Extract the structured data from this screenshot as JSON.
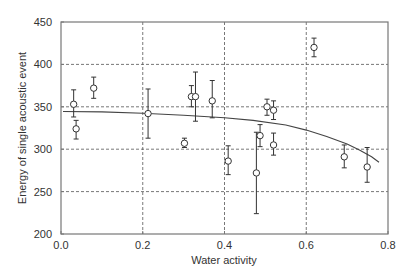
{
  "chart_data": {
    "type": "scatter",
    "title": "",
    "xlabel": "Water activity",
    "ylabel": "Energy of single acoustic event",
    "xlim": [
      0.0,
      0.8
    ],
    "ylim": [
      200,
      450
    ],
    "xticks": [
      "0.0",
      "0.2",
      "0.4",
      "0.6",
      "0.8"
    ],
    "yticks": [
      "200",
      "250",
      "300",
      "350",
      "400",
      "450"
    ],
    "grid": true,
    "legend": null,
    "series": [
      {
        "name": "Measured",
        "marker": "open-circle",
        "points": [
          {
            "x": 0.031,
            "y": 353,
            "err_low": 338,
            "err_high": 370
          },
          {
            "x": 0.037,
            "y": 324,
            "err_low": 312,
            "err_high": 334
          },
          {
            "x": 0.08,
            "y": 372,
            "err_low": 360,
            "err_high": 385
          },
          {
            "x": 0.213,
            "y": 342,
            "err_low": 313,
            "err_high": 371
          },
          {
            "x": 0.302,
            "y": 307,
            "err_low": 302,
            "err_high": 313
          },
          {
            "x": 0.319,
            "y": 362,
            "err_low": 350,
            "err_high": 375
          },
          {
            "x": 0.329,
            "y": 362,
            "err_low": 333,
            "err_high": 391
          },
          {
            "x": 0.37,
            "y": 357,
            "err_low": 337,
            "err_high": 381
          },
          {
            "x": 0.409,
            "y": 286,
            "err_low": 270,
            "err_high": 304
          },
          {
            "x": 0.478,
            "y": 272,
            "err_low": 224,
            "err_high": 320
          },
          {
            "x": 0.487,
            "y": 316,
            "err_low": 303,
            "err_high": 329
          },
          {
            "x": 0.504,
            "y": 350,
            "err_low": 340,
            "err_high": 359
          },
          {
            "x": 0.52,
            "y": 346,
            "err_low": 335,
            "err_high": 357
          },
          {
            "x": 0.52,
            "y": 305,
            "err_low": 293,
            "err_high": 319
          },
          {
            "x": 0.619,
            "y": 420,
            "err_low": 409,
            "err_high": 431
          },
          {
            "x": 0.693,
            "y": 291,
            "err_low": 278,
            "err_high": 305
          },
          {
            "x": 0.749,
            "y": 279,
            "err_low": 261,
            "err_high": 302
          }
        ]
      },
      {
        "name": "Fit",
        "type": "line",
        "x": [
          0.005,
          0.1,
          0.2,
          0.3,
          0.4,
          0.47,
          0.55,
          0.6,
          0.65,
          0.7,
          0.73,
          0.76,
          0.778
        ],
        "y": [
          344.5,
          344,
          342.5,
          340,
          337,
          334,
          328.5,
          322.5,
          315,
          306,
          299,
          291,
          284.5
        ]
      }
    ]
  }
}
